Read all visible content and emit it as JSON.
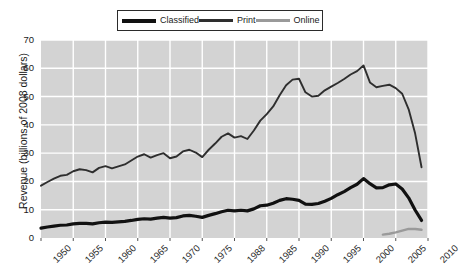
{
  "chart_data": {
    "type": "line",
    "title": "",
    "xlabel": "",
    "ylabel": "Revenue (billions of 2008 dollars)",
    "xlim": [
      1950,
      2010
    ],
    "ylim": [
      0,
      70
    ],
    "ytick_labels": [
      "0",
      "10",
      "20",
      "30",
      "40",
      "50",
      "60",
      "70"
    ],
    "ytick_values": [
      0,
      10,
      20,
      30,
      40,
      50,
      60,
      70
    ],
    "xtick_labels": [
      "1950",
      "1955",
      "1960",
      "1965",
      "1970",
      "1975",
      "1988",
      "1985",
      "1990",
      "1995",
      "2000",
      "2005",
      "2010"
    ],
    "xtick_values": [
      1950,
      1955,
      1960,
      1965,
      1970,
      1975,
      1980,
      1985,
      1990,
      1995,
      2000,
      2005,
      2010
    ],
    "grid": true,
    "legend_position": "top-center",
    "plot_background": "#d3d3d3",
    "gridline_color": "#ffffff",
    "series": [
      {
        "name": "Classified",
        "color": "#111111",
        "width": 3.2,
        "x": [
          1950,
          1951,
          1952,
          1953,
          1954,
          1955,
          1956,
          1957,
          1958,
          1959,
          1960,
          1961,
          1962,
          1963,
          1964,
          1965,
          1966,
          1967,
          1968,
          1969,
          1970,
          1971,
          1972,
          1973,
          1974,
          1975,
          1976,
          1977,
          1978,
          1979,
          1980,
          1981,
          1982,
          1983,
          1984,
          1985,
          1986,
          1987,
          1988,
          1989,
          1990,
          1991,
          1992,
          1993,
          1994,
          1995,
          1996,
          1997,
          1998,
          1999,
          2000,
          2001,
          2002,
          2003,
          2004,
          2005,
          2006,
          2007,
          2008,
          2009
        ],
        "values": [
          3.5,
          3.9,
          4.2,
          4.5,
          4.6,
          5.0,
          5.2,
          5.2,
          5.0,
          5.4,
          5.6,
          5.5,
          5.7,
          5.9,
          6.2,
          6.6,
          6.8,
          6.7,
          7.0,
          7.3,
          7.0,
          7.2,
          7.8,
          8.0,
          7.7,
          7.3,
          8.0,
          8.6,
          9.3,
          9.8,
          9.6,
          9.8,
          9.6,
          10.3,
          11.4,
          11.6,
          12.3,
          13.3,
          13.9,
          13.7,
          13.3,
          12.0,
          11.9,
          12.2,
          13.0,
          14.0,
          15.3,
          16.4,
          17.8,
          19.0,
          21.0,
          19.2,
          17.7,
          17.8,
          18.8,
          19.1,
          17.3,
          14.2,
          9.9,
          6.2
        ]
      },
      {
        "name": "Print",
        "color": "#2e2e2e",
        "width": 1.9,
        "x": [
          1950,
          1951,
          1952,
          1953,
          1954,
          1955,
          1956,
          1957,
          1958,
          1959,
          1960,
          1961,
          1962,
          1963,
          1964,
          1965,
          1966,
          1967,
          1968,
          1969,
          1970,
          1971,
          1972,
          1973,
          1974,
          1975,
          1976,
          1977,
          1978,
          1979,
          1980,
          1981,
          1982,
          1983,
          1984,
          1985,
          1986,
          1987,
          1988,
          1989,
          1990,
          1991,
          1992,
          1993,
          1994,
          1995,
          1996,
          1997,
          1998,
          1999,
          2000,
          2001,
          2002,
          2003,
          2004,
          2005,
          2006,
          2007,
          2008,
          2009
        ],
        "values": [
          18.5,
          19.8,
          21.0,
          22.0,
          22.3,
          23.6,
          24.3,
          24.0,
          23.2,
          24.8,
          25.4,
          24.6,
          25.3,
          26.0,
          27.4,
          28.8,
          29.6,
          28.4,
          29.3,
          30.0,
          28.2,
          28.8,
          30.6,
          31.2,
          30.2,
          28.6,
          31.2,
          33.4,
          35.8,
          37.0,
          35.5,
          36.0,
          35.0,
          38.0,
          41.5,
          43.8,
          46.5,
          50.5,
          54.0,
          56.0,
          56.3,
          51.5,
          50.0,
          50.3,
          52.2,
          53.5,
          54.8,
          56.2,
          57.8,
          59.0,
          61.0,
          55.0,
          53.3,
          53.8,
          54.2,
          53.0,
          51.0,
          45.5,
          37.0,
          25.0
        ]
      },
      {
        "name": "Online",
        "color": "#9a9a9a",
        "width": 2.4,
        "x": [
          2003,
          2004,
          2005,
          2006,
          2007,
          2008,
          2009
        ],
        "values": [
          1.2,
          1.5,
          2.0,
          2.6,
          3.2,
          3.2,
          2.9
        ]
      }
    ]
  },
  "legend": {
    "items": [
      {
        "label": "Classified",
        "color": "#111111",
        "thickness": 4
      },
      {
        "label": "Print",
        "color": "#2e2e2e",
        "thickness": 2.5
      },
      {
        "label": "Online",
        "color": "#9a9a9a",
        "thickness": 3
      }
    ]
  }
}
